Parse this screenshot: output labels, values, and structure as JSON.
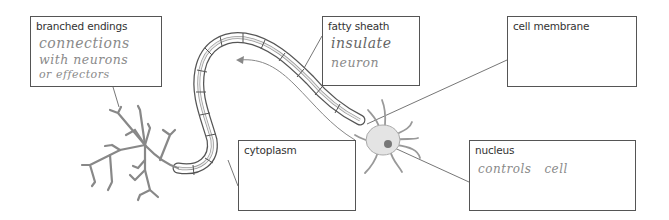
{
  "diagram": {
    "labels": [
      {
        "id": "branched-endings",
        "label": "branched endings",
        "answer_lines": [
          "connections",
          "with neurons",
          "or effectors"
        ]
      },
      {
        "id": "fatty-sheath",
        "label": "fatty sheath",
        "answer_lines": [
          "insulate",
          "neuron"
        ]
      },
      {
        "id": "cell-membrane",
        "label": "cell membrane",
        "answer_lines": []
      },
      {
        "id": "cytoplasm",
        "label": "cytoplasm",
        "answer_lines": []
      },
      {
        "id": "nucleus",
        "label": "nucleus",
        "answer_lines": [
          "controls   cell"
        ]
      }
    ],
    "colors": {
      "outline": "#555555",
      "cell_fill": "#e4e4e4",
      "nucleus_fill": "#777777",
      "handwriting": "#8a8a8a"
    }
  }
}
